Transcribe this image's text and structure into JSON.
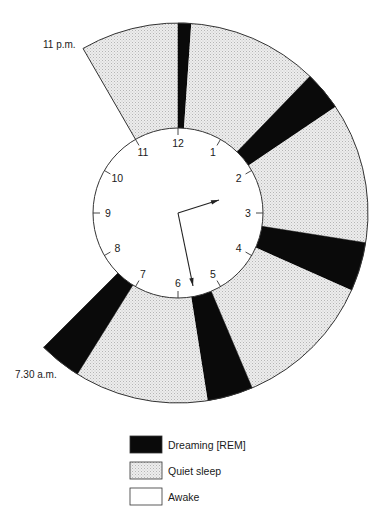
{
  "diagram": {
    "title_fragment": "",
    "center": [
      178,
      213
    ],
    "inner_radius": 85,
    "outer_radius": 190,
    "start_label": "11 p.m.",
    "end_label": "7.30 a.m.",
    "clock_numbers": [
      "12",
      "1",
      "2",
      "3",
      "4",
      "5",
      "6",
      "7",
      "8",
      "9",
      "10",
      "11"
    ],
    "hands": {
      "hour_tip": [
        219,
        200
      ],
      "minute_tip": [
        193,
        286
      ]
    },
    "segments": [
      {
        "state": "quiet",
        "start_deg": -30,
        "end_deg": 0
      },
      {
        "state": "rem",
        "start_deg": 0,
        "end_deg": 4
      },
      {
        "state": "quiet",
        "start_deg": 4,
        "end_deg": 44
      },
      {
        "state": "rem",
        "start_deg": 44,
        "end_deg": 56
      },
      {
        "state": "quiet",
        "start_deg": 56,
        "end_deg": 99
      },
      {
        "state": "rem",
        "start_deg": 99,
        "end_deg": 114
      },
      {
        "state": "quiet",
        "start_deg": 114,
        "end_deg": 157
      },
      {
        "state": "rem",
        "start_deg": 157,
        "end_deg": 171
      },
      {
        "state": "quiet",
        "start_deg": 171,
        "end_deg": 212
      },
      {
        "state": "rem",
        "start_deg": 212,
        "end_deg": 225
      }
    ],
    "colors": {
      "rem": "#0a0a0a",
      "quiet": "#e6e6e6",
      "awake": "#ffffff",
      "stroke": "#333333"
    }
  },
  "legend": {
    "items": [
      {
        "state": "rem",
        "label": "Dreaming [REM]"
      },
      {
        "state": "quiet",
        "label": "Quiet sleep"
      },
      {
        "state": "awake",
        "label": "Awake"
      }
    ]
  }
}
